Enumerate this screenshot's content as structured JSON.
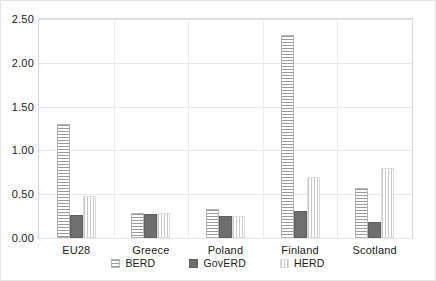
{
  "chart_data": {
    "type": "bar",
    "title": "",
    "xlabel": "",
    "ylabel": "",
    "ylim": [
      0.0,
      2.5
    ],
    "yticks": [
      "0.00",
      "0.50",
      "1.00",
      "1.50",
      "2.00",
      "2.50"
    ],
    "ytick_values": [
      0.0,
      0.5,
      1.0,
      1.5,
      2.0,
      2.5
    ],
    "grid": true,
    "legend_position": "bottom",
    "categories": [
      "EU28",
      "Greece",
      "Poland",
      "Finland",
      "Scotland"
    ],
    "series": [
      {
        "name": "BERD",
        "pattern": "horizontal-hatch",
        "color": "#9a9a9a",
        "values": [
          1.3,
          0.28,
          0.33,
          2.32,
          0.57
        ]
      },
      {
        "name": "GovERD",
        "pattern": "solid",
        "color": "#6e6e6e",
        "values": [
          0.26,
          0.27,
          0.25,
          0.31,
          0.18
        ]
      },
      {
        "name": "HERD",
        "pattern": "vertical-hatch",
        "color": "#c9c9c9",
        "values": [
          0.48,
          0.29,
          0.25,
          0.7,
          0.8
        ]
      }
    ]
  }
}
